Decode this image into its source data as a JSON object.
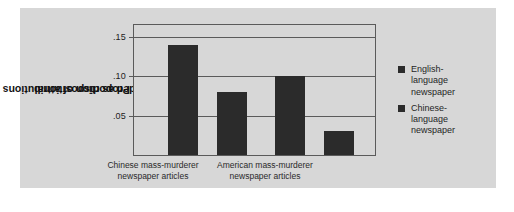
{
  "chart_data": {
    "type": "bar",
    "title": "",
    "xlabel": "",
    "ylabel": "Proportion of attributions coded as dispositional",
    "ylim": [
      0,
      0.165
    ],
    "yticks": [
      ".05",
      ".10",
      ".15"
    ],
    "ytick_values": [
      0.05,
      0.1,
      0.15
    ],
    "grid": true,
    "legend_position": "right",
    "categories": [
      "Chinese mass-murderer newspaper articles",
      "American mass-murderer newspaper articles"
    ],
    "series": [
      {
        "name": "English-language newspaper",
        "values": [
          0.14,
          0.1
        ],
        "color": "#2b2b2b"
      },
      {
        "name": "Chinese-language newspaper",
        "values": [
          0.08,
          0.03
        ],
        "color": "#2b2b2b"
      }
    ]
  },
  "axis": {
    "y_title_line1": "Proportion of attributions",
    "y_title_line2": "coded as dispositional",
    "tick_0": ".15",
    "tick_1": ".10",
    "tick_2": ".05"
  },
  "categories": [
    {
      "line1": "Chinese mass-murderer",
      "line2": "newspaper articles"
    },
    {
      "line1": "American mass-murderer",
      "line2": "newspaper articles"
    }
  ],
  "legend": {
    "items": [
      {
        "line1": "English-",
        "line2": "language",
        "line3": "newspaper"
      },
      {
        "line1": "Chinese-",
        "line2": "language",
        "line3": "newspaper"
      }
    ]
  },
  "colors": {
    "figure_background": "#d7d7d7",
    "page_background": "#ffffff",
    "bar": "#2b2b2b",
    "axis": "#5a5a5a"
  }
}
